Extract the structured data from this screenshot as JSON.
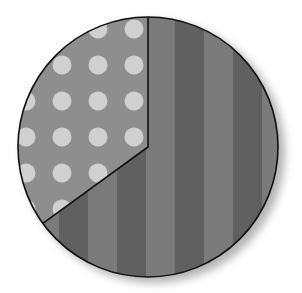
{
  "chart_data": {
    "type": "pie",
    "title": "",
    "slices": [
      {
        "label": "",
        "value": 65,
        "pattern": "vertical-stripes",
        "colors": [
          "#7b7b7b",
          "#606060"
        ]
      },
      {
        "label": "",
        "value": 35,
        "pattern": "polka-dots",
        "colors": [
          "#8e8e8e",
          "#d0d0d0"
        ]
      }
    ],
    "start_angle_deg": 0,
    "direction": "clockwise",
    "legend": "none",
    "style": {
      "outline_color": "#111111",
      "shadow": true,
      "center": [
        148,
        147
      ],
      "radius": 130
    }
  }
}
